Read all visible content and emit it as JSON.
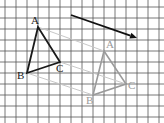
{
  "diagram": {
    "type": "translation-on-grid",
    "grid": {
      "cell_size": 11,
      "x_lines": [
        5,
        16,
        27,
        38,
        49,
        60,
        71,
        82,
        93,
        104,
        115,
        126,
        137,
        148,
        159
      ],
      "y_lines": [
        7,
        18,
        29,
        40,
        51,
        62,
        73,
        84,
        95,
        106,
        117
      ],
      "color": "#555555"
    },
    "original_triangle": {
      "color": "#1a1a1a",
      "vertices": {
        "A": {
          "label": "A",
          "x": 38,
          "y": 27
        },
        "B": {
          "label": "B",
          "x": 27,
          "y": 73
        },
        "C": {
          "label": "C",
          "x": 60,
          "y": 62
        }
      }
    },
    "image_triangle": {
      "color": "#9a9a9a",
      "vertices": {
        "A": {
          "label": "A",
          "x": 104,
          "y": 51
        },
        "B": {
          "label": "B",
          "x": 93,
          "y": 95
        },
        "C": {
          "label": "C",
          "x": 126,
          "y": 84
        }
      }
    },
    "connector_color": "#c8c8c8",
    "translation_vector": {
      "color": "#111111",
      "from": {
        "x": 71,
        "y": 15
      },
      "to": {
        "x": 137,
        "y": 38
      }
    }
  }
}
